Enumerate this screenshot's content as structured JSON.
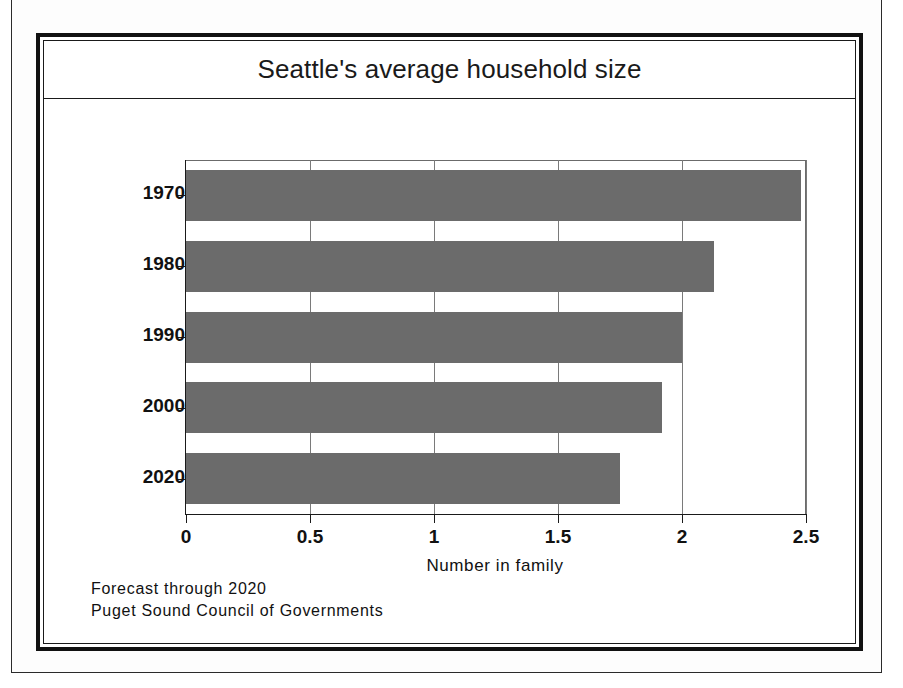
{
  "chart_data": {
    "type": "bar",
    "orientation": "horizontal",
    "title": "Seattle's average household size",
    "subtitle": "",
    "categories": [
      "1970",
      "1980",
      "1990",
      "2000",
      "2020"
    ],
    "values": [
      2.48,
      2.13,
      2.0,
      1.92,
      1.75
    ],
    "series": [
      {
        "name": "Average household size",
        "values": [
          2.48,
          2.13,
          2.0,
          1.92,
          1.75
        ]
      }
    ],
    "xlabel": "Number in family",
    "ylabel": "",
    "xlim": [
      0,
      2.5
    ],
    "xticks": [
      0,
      0.5,
      1,
      1.5,
      2,
      2.5
    ],
    "xtick_labels": [
      "0",
      "0.5",
      "1",
      "1.5",
      "2",
      "2.5"
    ],
    "grid": "vertical",
    "legend": "none",
    "bar_color": "#6b6b6b",
    "annotations": [
      "Forecast through 2020",
      "Puget Sound Council of Governments"
    ]
  },
  "footnotes": {
    "line1": "Forecast through 2020",
    "line2": "Puget Sound Council of Governments"
  },
  "colors": {
    "bar": "#6b6b6b",
    "frame": "#111111",
    "grid": "#7a7a7a",
    "text": "#111111"
  }
}
